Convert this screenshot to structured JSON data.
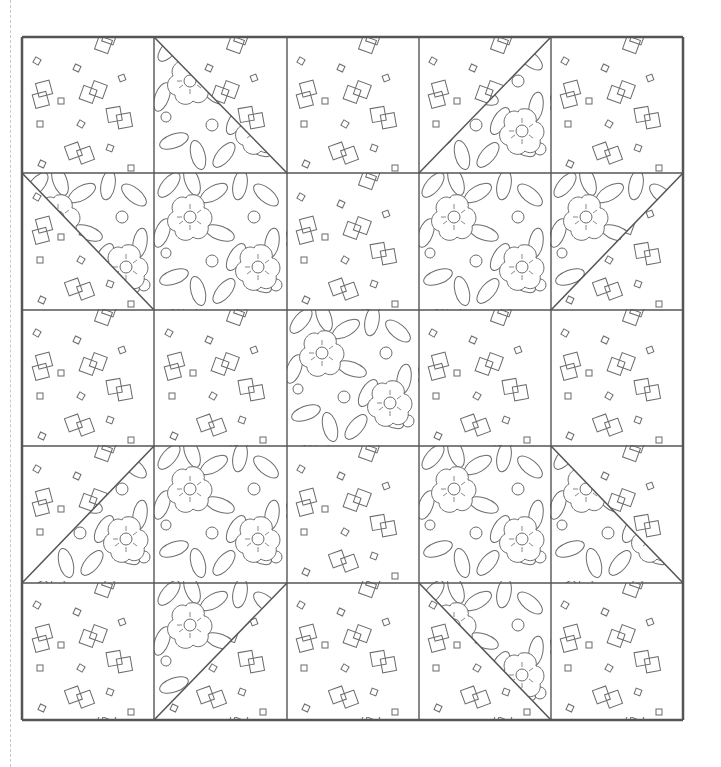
{
  "block": {
    "grid_size": 5,
    "fabrics": {
      "light": "squares-print",
      "dark": "floral-print"
    },
    "colors": {
      "line": "#555555",
      "fabric_line": "#6a6a6a",
      "background": "#ffffff",
      "cut_line": "#c9c9c9"
    },
    "cells": [
      [
        {
          "type": "solid",
          "fabric": "light"
        },
        {
          "type": "hst",
          "diag": "tl-br",
          "floral": "bottom-left"
        },
        {
          "type": "solid",
          "fabric": "light"
        },
        {
          "type": "hst",
          "diag": "bl-tr",
          "floral": "bottom-right"
        },
        {
          "type": "solid",
          "fabric": "light"
        }
      ],
      [
        {
          "type": "hst",
          "diag": "tl-br",
          "floral": "top-right"
        },
        {
          "type": "solid",
          "fabric": "dark"
        },
        {
          "type": "solid",
          "fabric": "light"
        },
        {
          "type": "solid",
          "fabric": "dark"
        },
        {
          "type": "hst",
          "diag": "bl-tr",
          "floral": "top-left"
        }
      ],
      [
        {
          "type": "solid",
          "fabric": "light"
        },
        {
          "type": "solid",
          "fabric": "light"
        },
        {
          "type": "solid",
          "fabric": "dark"
        },
        {
          "type": "solid",
          "fabric": "light"
        },
        {
          "type": "solid",
          "fabric": "light"
        }
      ],
      [
        {
          "type": "hst",
          "diag": "bl-tr",
          "floral": "bottom-right"
        },
        {
          "type": "solid",
          "fabric": "dark"
        },
        {
          "type": "solid",
          "fabric": "light"
        },
        {
          "type": "solid",
          "fabric": "dark"
        },
        {
          "type": "hst",
          "diag": "tl-br",
          "floral": "bottom-left"
        }
      ],
      [
        {
          "type": "solid",
          "fabric": "light"
        },
        {
          "type": "hst",
          "diag": "bl-tr",
          "floral": "top-left"
        },
        {
          "type": "solid",
          "fabric": "light"
        },
        {
          "type": "hst",
          "diag": "tl-br",
          "floral": "top-right"
        },
        {
          "type": "solid",
          "fabric": "light"
        }
      ]
    ]
  }
}
